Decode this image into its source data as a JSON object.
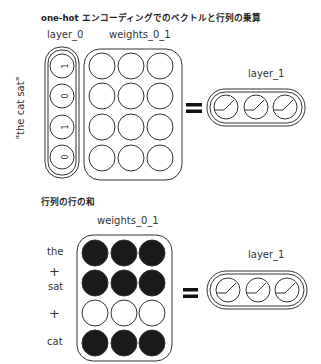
{
  "section1": {
    "title": "one-hot エンコーディングでのベクトルと行列の乗算",
    "layer0_label": "layer_0",
    "weights_label": "weights_0_1",
    "layer1_label": "layer_1",
    "side_label": "\"the cat sat\"",
    "layer0_values": [
      "1",
      "0",
      "1",
      "0"
    ],
    "weights_rows": 4,
    "weights_cols": 3,
    "operator": "="
  },
  "section2": {
    "title": "行列の行の和",
    "weights_label": "weights_0_1",
    "layer1_label": "layer_1",
    "row_words": [
      "the",
      "+",
      "sat",
      "+",
      "cat"
    ],
    "row_filled": [
      true,
      true,
      false,
      true
    ],
    "operator": "="
  },
  "colors": {
    "stroke": "#333333",
    "filled": "#1a1a1a",
    "background": "#ffffff"
  }
}
